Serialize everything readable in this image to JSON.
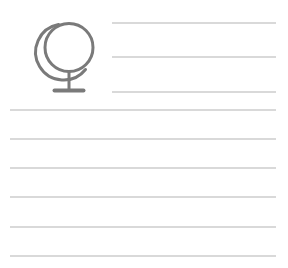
{
  "page": {
    "background_color": "#ffffff",
    "width": 288,
    "height": 268
  },
  "icon": {
    "name": "globe-icon",
    "label": "Desk globe",
    "stroke_color": "#7a7a7a",
    "stroke_width": 3,
    "parts": [
      {
        "name": "globe-sphere",
        "label": "Sphere"
      },
      {
        "name": "globe-meridian-arc",
        "label": "Meridian arc"
      },
      {
        "name": "globe-stand-post",
        "label": "Stand post"
      },
      {
        "name": "globe-stand-base",
        "label": "Stand base"
      }
    ]
  },
  "ruled_lines": {
    "line_color": "#d9d9d9",
    "line_thickness": 2,
    "short_count": 3,
    "full_count": 6,
    "short_lines": [
      {
        "id": "short-line-1",
        "text": ""
      },
      {
        "id": "short-line-2",
        "text": ""
      },
      {
        "id": "short-line-3",
        "text": ""
      }
    ],
    "full_lines": [
      {
        "id": "full-line-1",
        "text": ""
      },
      {
        "id": "full-line-2",
        "text": ""
      },
      {
        "id": "full-line-3",
        "text": ""
      },
      {
        "id": "full-line-4",
        "text": ""
      },
      {
        "id": "full-line-5",
        "text": ""
      },
      {
        "id": "full-line-6",
        "text": ""
      }
    ]
  }
}
